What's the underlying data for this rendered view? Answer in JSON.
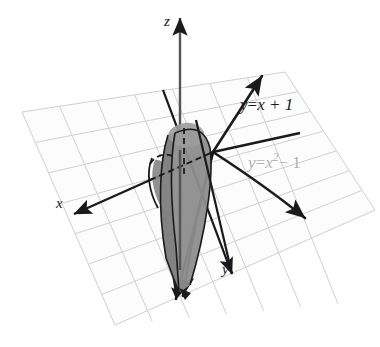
{
  "figure": {
    "background": "#ffffff",
    "axes": {
      "z": {
        "label": "z",
        "name": "z-axis",
        "direction": "up"
      },
      "x": {
        "label": "x",
        "name": "x-axis",
        "direction": "lower-left"
      },
      "y": {
        "label": "y",
        "name": "y-axis",
        "direction": "lower-right"
      }
    },
    "curves": [
      {
        "name": "line-y-equals-x-plus-1",
        "label_lhs": "y",
        "label_eq": "=",
        "label_rhs": "x + 1",
        "label_full": "y = x + 1",
        "color": "#1a1a1a",
        "style": "solid",
        "arrowheads": 2
      },
      {
        "name": "parabola-y-equals-x-squared-minus-1",
        "label_lhs": "y",
        "label_eq": "=",
        "label_rhs_base": "x",
        "label_rhs_exp": "2",
        "label_rhs_tail": "− 1",
        "label_full": "y = x² − 1",
        "color": "#1a1a1a",
        "label_color": "#b2b2b2",
        "style": "solid",
        "arrowheads": 2
      }
    ],
    "solid": {
      "name": "shaded-solid-region",
      "description": "vertical cylinder over region between line and parabola",
      "face_right_color": "#8d8d8d",
      "face_left_color": "#787878",
      "face_top_color": "#9c9c9c",
      "face_front_color": "#a2a2a2",
      "outline_color": "#1a1a1a"
    },
    "grid": {
      "name": "xy-plane-grid",
      "line_color": "#cfcfcf",
      "fill_color": "#fcfcfc",
      "divisions": 7
    },
    "dashed": {
      "name": "hidden-edge-dashed-lines",
      "color": "#1a1a1a",
      "style": "dashed"
    }
  }
}
